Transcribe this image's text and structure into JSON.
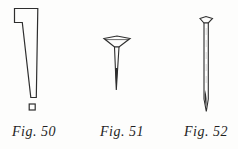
{
  "document": {
    "kind": "scanned-book-figures",
    "background_color": "#fdfdfc",
    "ink_color": "#2e2e2e",
    "figures": [
      {
        "caption": "Fig. 50",
        "subject": "cut-nail"
      },
      {
        "caption": "Fig. 51",
        "subject": "tack"
      },
      {
        "caption": "Fig. 52",
        "subject": "wire-nail"
      }
    ]
  }
}
